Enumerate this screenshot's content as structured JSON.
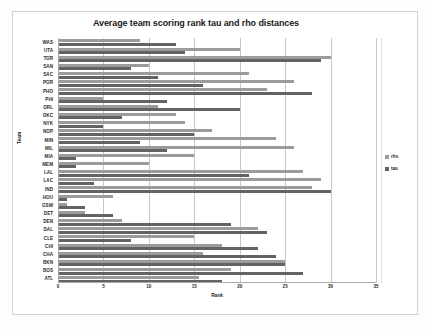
{
  "chart_data": {
    "type": "bar",
    "orientation": "horizontal",
    "title": "Average team scoring rank tau and rho distances",
    "xlabel": "Rank",
    "ylabel": "Team",
    "xlim": [
      0,
      35
    ],
    "xticks": [
      0,
      5,
      10,
      15,
      20,
      25,
      30,
      35
    ],
    "grid": true,
    "legend_position": "right",
    "categories": [
      "ATL",
      "BOS",
      "BKN",
      "CHA",
      "CHI",
      "CLE",
      "DAL",
      "DEN",
      "DET",
      "GSW",
      "HOU",
      "IND",
      "LAC",
      "LAL",
      "MEM",
      "MIA",
      "MIL",
      "MIN",
      "NOP",
      "NYK",
      "OKC",
      "ORL",
      "PHI",
      "PHO",
      "POR",
      "SAC",
      "SAN",
      "TOR",
      "UTA",
      "WAS"
    ],
    "series": [
      {
        "name": "rho",
        "color": "#9b9b9b",
        "values": [
          15.5,
          19,
          25,
          16,
          18,
          15,
          22,
          7,
          3,
          1,
          6,
          28,
          29,
          27,
          10,
          15,
          26,
          24,
          17,
          14,
          13,
          11,
          5,
          23,
          26,
          21,
          10,
          30,
          20,
          9
        ]
      },
      {
        "name": "tau",
        "color": "#636363",
        "values": [
          18,
          27,
          25,
          24,
          22,
          8,
          23,
          19,
          6,
          3,
          1,
          30,
          4,
          21,
          2,
          2,
          12,
          9,
          15,
          5,
          7,
          20,
          12,
          28,
          16,
          11,
          8,
          29,
          14,
          13
        ]
      }
    ]
  },
  "legend": {
    "items": [
      {
        "label": "rho",
        "color": "#9b9b9b"
      },
      {
        "label": "tau",
        "color": "#636363"
      }
    ]
  }
}
